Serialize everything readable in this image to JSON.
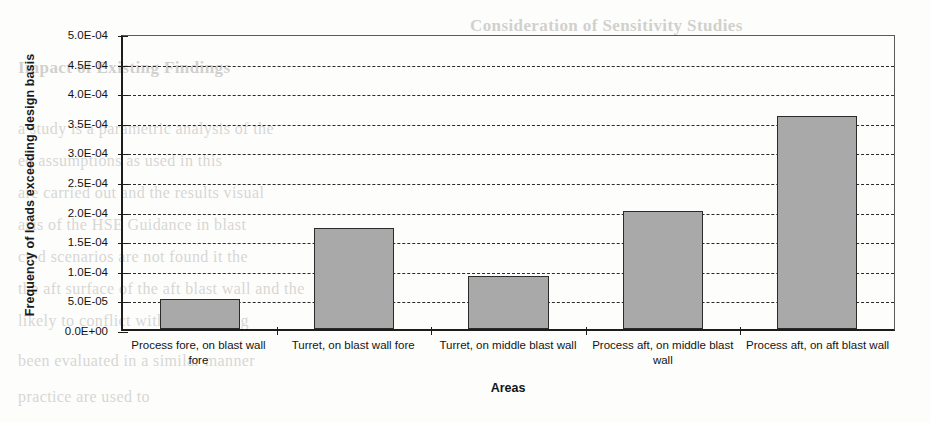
{
  "chart_data": {
    "type": "bar",
    "title": "",
    "xlabel": "Areas",
    "ylabel": "Frequency of loads exceeding design basis",
    "categories": [
      "Process fore, on blast wall fore",
      "Turret, on blast wall fore",
      "Turret, on middle blast wall",
      "Process aft, on middle blast wall",
      "Process aft, on aft blast wall"
    ],
    "values": [
      5e-05,
      0.00017,
      9e-05,
      0.0002,
      0.00036
    ],
    "value_labels": [
      "5.0E-05",
      "1.7E-04",
      "9.0E-05",
      "2.0E-04",
      "3.6E-04"
    ],
    "ylim": [
      0,
      0.0005
    ],
    "ytick_values": [
      0.0005,
      0.00045,
      0.0004,
      0.00035,
      0.0003,
      0.00025,
      0.0002,
      0.00015,
      0.0001,
      5e-05,
      0
    ],
    "ytick_labels": [
      "5.0E-04",
      "4.5E-04",
      "4.0E-04",
      "3.5E-04",
      "3.0E-04",
      "2.5E-04",
      "2.0E-04",
      "1.5E-04",
      "1.0E-04",
      "5.0E-05",
      "0.0E+00"
    ],
    "grid": true,
    "gridstyle": "dashed-horizontal",
    "legend": "none",
    "bar_color": "#a9a9a9",
    "bar_edge_color": "#2b2b2b",
    "axis_color": "#1d1d1d"
  },
  "background_ghost_text": {
    "note": "faint bleed-through from reverse of scanned page",
    "lines": [
      "Consideration of Sensitivity Studies",
      "Impact of Existing Findings",
      "Consideration of Sensitivity Studies",
      "a study is a parametric analysis of the",
      "ed assumptions as used in this",
      "are carried out and the results visual",
      "asis of the HSE Guidance in blast",
      "cted scenarios are not found it the",
      "the aft surface of the aft blast wall and the",
      "likely to conflict with the existing",
      "been evaluated in a similar manner",
      "practice are used to"
    ]
  }
}
